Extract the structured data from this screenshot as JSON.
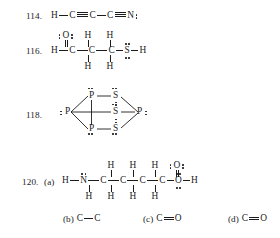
{
  "page": {
    "background": "#ffffff",
    "ink": "#1c1c1c"
  },
  "problems": [
    {
      "number": "114.",
      "type": "lewis-structure-linear",
      "formula": "H-C≡C-C≡N:",
      "atoms": [
        "H",
        "C",
        "C",
        "C",
        "N"
      ],
      "bonds": [
        "single",
        "triple",
        "single",
        "triple"
      ],
      "lone_pairs": {
        "N": 1
      }
    },
    {
      "number": "116.",
      "type": "lewis-structure-branched",
      "main_chain": [
        "H",
        "C",
        "C",
        "C",
        "S",
        "H"
      ],
      "main_bonds": [
        "single",
        "single",
        "single",
        "single",
        "single"
      ],
      "substituent_O": "O",
      "substituent_O_bond": "double",
      "top_hydrogens": [
        "H",
        "H"
      ],
      "bottom_hydrogens": [
        "H",
        "H"
      ],
      "lone_pairs": {
        "O": 2,
        "S": 2
      }
    },
    {
      "number": "118.",
      "type": "lewis-structure-cage",
      "formula": "P4S3",
      "atoms": [
        "P",
        "S",
        "P",
        "S",
        "P",
        "S",
        "P"
      ],
      "left_phosphorus": "P",
      "right_phosphorus": "P",
      "top_phosphorus": "P",
      "middle_sulfur": "S",
      "bottom_phosphorus": "P",
      "top_sulfur": "S",
      "bottom_sulfur": "S"
    },
    {
      "number": "120.",
      "part": "(a)",
      "type": "lewis-structure-branched",
      "main_chain": [
        "H",
        "N",
        "C",
        "C",
        "C",
        "C",
        "O",
        "H"
      ],
      "main_bonds": [
        "single",
        "single",
        "single",
        "single",
        "single",
        "single",
        "single"
      ],
      "carbonyl_O": "O",
      "carbonyl_bond": "double",
      "top_hydrogens": [
        "H",
        "H",
        "H"
      ],
      "bottom_hydrogens": [
        "H",
        "H",
        "H",
        "H"
      ],
      "lone_pairs": {
        "N": 1,
        "carbonyl_O": 2,
        "hydroxyl_O": 2
      }
    }
  ],
  "answers": [
    {
      "label": "(b)",
      "left": "C",
      "bond": "single",
      "right": "C"
    },
    {
      "label": "(c)",
      "left": "C",
      "bond": "double",
      "right": "O"
    },
    {
      "label": "(d)",
      "left": "C",
      "bond": "double",
      "right": "O"
    }
  ]
}
